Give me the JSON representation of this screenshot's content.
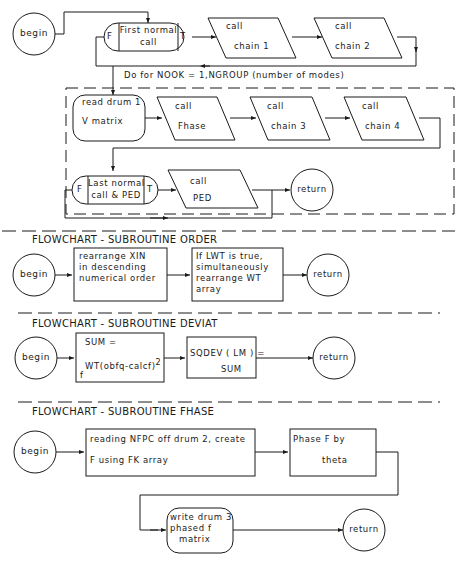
{
  "main_flowchart": {
    "begin": "begin",
    "first_normal_call": {
      "false_label": "F",
      "line1": "First normal",
      "line2": "call",
      "true_label": "T"
    },
    "chain1": {
      "line1": "call",
      "line2": "chain  1"
    },
    "chain2": {
      "line1": "call",
      "line2": "chain  2"
    },
    "loop_label": "Do for NOOK = 1,NGROUP (number of modes)",
    "read_drum": {
      "line1": "read drum 1",
      "line2": "V matrix"
    },
    "fhase": {
      "line1": "call",
      "line2": "Fhase"
    },
    "chain3": {
      "line1": "call",
      "line2": "chain  3"
    },
    "chain4": {
      "line1": "call",
      "line2": "chain  4"
    },
    "last_normal_call": {
      "false_label": "F",
      "line1": "Last normal",
      "line2": "call & PED",
      "true_label": "T"
    },
    "ped": {
      "line1": "call",
      "line2": "PED"
    },
    "return": "return"
  },
  "order": {
    "title": "FLOWCHART - SUBROUTINE   ORDER",
    "begin": "begin",
    "box1": [
      "rearrange XIN",
      "in descending",
      "numerical order"
    ],
    "box2": [
      "If LWT is true,",
      "simultaneously",
      "rearrange  WT",
      "array"
    ],
    "return": "return"
  },
  "deviat": {
    "title": "FLOWCHART - SUBROUTINE   DEVIAT",
    "begin": "begin",
    "box1": {
      "line1": "SUM  =",
      "line2": "WT(obfq-calcf)",
      "exponent": "2",
      "subscript": "f"
    },
    "box2": {
      "line1": "SQDEV ( LM ) =",
      "line2": "SUM"
    },
    "return": "return"
  },
  "fhase": {
    "title": "FLOWCHART - SUBROUTINE   FHASE",
    "begin": "begin",
    "box1": {
      "line1": "reading NFPC off drum 2, create",
      "line2": "F using  FK array"
    },
    "box2": {
      "line1": "Phase  F  by",
      "line2": "theta"
    },
    "box3": [
      "write drum 3",
      "phased  f",
      "matrix"
    ],
    "return": "return"
  }
}
